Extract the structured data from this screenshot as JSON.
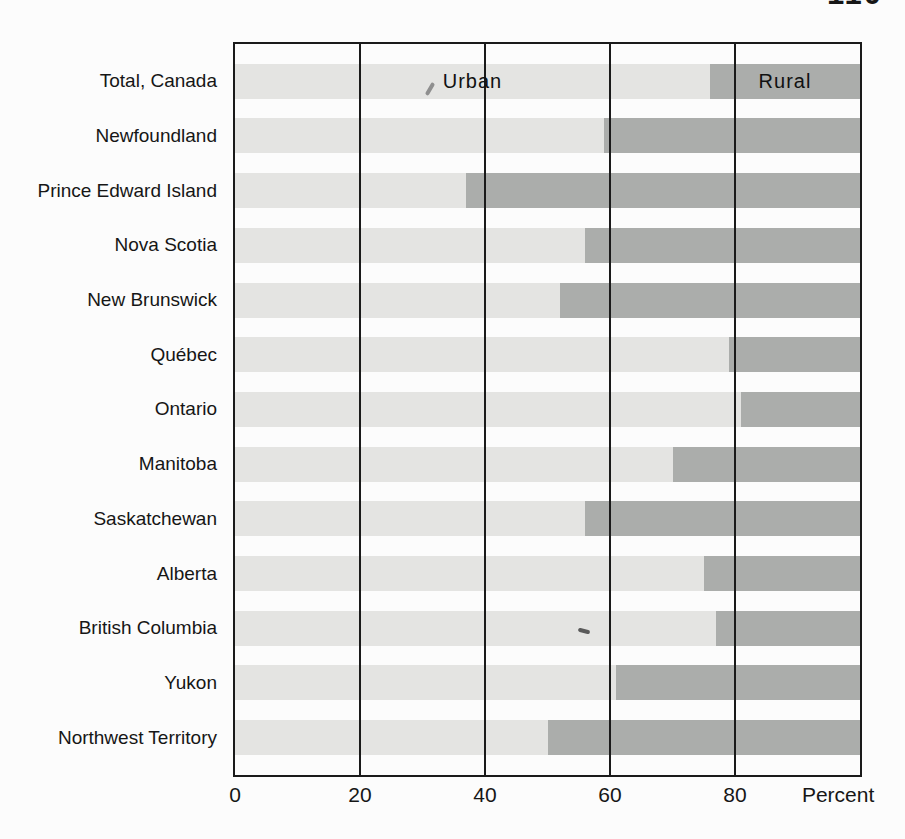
{
  "page": {
    "page_number": "110"
  },
  "chart_data": {
    "type": "bar",
    "orientation": "horizontal",
    "stacked": true,
    "title": "",
    "xlabel": "Percent",
    "x_ticks": [
      0,
      20,
      40,
      60,
      80
    ],
    "xlim": [
      0,
      100
    ],
    "grid": "vertical-lines-at-ticks",
    "legend_position": "inline-first-bar",
    "segment_labels": {
      "urban": "Urban",
      "rural": "Rural"
    },
    "categories": [
      "Total, Canada",
      "Newfoundland",
      "Prince Edward Island",
      "Nova Scotia",
      "New Brunswick",
      "Québec",
      "Ontario",
      "Manitoba",
      "Saskatchewan",
      "Alberta",
      "British Columbia",
      "Yukon",
      "Northwest Territory"
    ],
    "series": [
      {
        "name": "Urban",
        "color": "#e4e4e2",
        "values": [
          76,
          59,
          37,
          56,
          52,
          79,
          81,
          70,
          56,
          75,
          77,
          61,
          50
        ]
      },
      {
        "name": "Rural",
        "color": "#abadab",
        "values": [
          24,
          41,
          63,
          44,
          48,
          21,
          19,
          30,
          44,
          25,
          23,
          39,
          50
        ]
      }
    ],
    "colors": {
      "urban": "#e4e4e2",
      "rural": "#abadab",
      "frame": "#1a1a1a",
      "background": "#fcfcfc"
    }
  }
}
